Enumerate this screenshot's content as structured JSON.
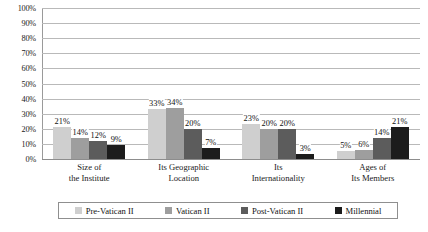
{
  "chart_data": {
    "type": "bar",
    "title": "",
    "subtitle": "",
    "xlabel": "",
    "ylabel": "",
    "ylim": [
      0,
      100
    ],
    "ytick_labels": [
      "100%",
      "90%",
      "80%",
      "70%",
      "60%",
      "50%",
      "40%",
      "30%",
      "20%",
      "10%",
      "0%"
    ],
    "ytick_values": [
      100,
      90,
      80,
      70,
      60,
      50,
      40,
      30,
      20,
      10,
      0
    ],
    "grid": true,
    "legend_position": "bottom",
    "categories": [
      "Size of\nthe Institute",
      "Its Geographic\nLocation",
      "Its\nInternationality",
      "Ages of\nIts Members"
    ],
    "category_lines": [
      [
        "Size of",
        "the Institute"
      ],
      [
        "Its Geographic",
        "Location"
      ],
      [
        "Its",
        "Internationality"
      ],
      [
        "Ages of",
        "Its Members"
      ]
    ],
    "series": [
      {
        "name": "Pre-Vatican II",
        "color": "#cfcfcf",
        "values": [
          21,
          33,
          23,
          5
        ],
        "labels": [
          "21%",
          "33%",
          "23%",
          "5%"
        ]
      },
      {
        "name": "Vatican II",
        "color": "#9e9e9e",
        "values": [
          14,
          34,
          20,
          6
        ],
        "labels": [
          "14%",
          "34%",
          "20%",
          "6%"
        ]
      },
      {
        "name": "Post-Vatican II",
        "color": "#5c5c5c",
        "values": [
          12,
          20,
          20,
          14
        ],
        "labels": [
          "12%",
          "20%",
          "20%",
          "14%"
        ]
      },
      {
        "name": "Millennial",
        "color": "#1c1c1c",
        "values": [
          9,
          7,
          3,
          21
        ],
        "labels": [
          "9%",
          "7%",
          "3%",
          "21%"
        ]
      }
    ]
  }
}
